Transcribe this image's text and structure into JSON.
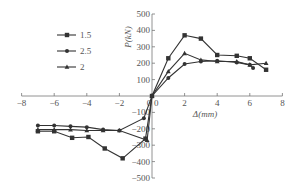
{
  "chart_data": {
    "type": "line",
    "title": "",
    "xlabel": "Δ(mm)",
    "ylabel": "P(kN)",
    "xlim": [
      -8,
      8
    ],
    "ylim": [
      -500,
      500
    ],
    "x_ticks": [
      -8,
      -6,
      -4,
      -2,
      0,
      2,
      4,
      6,
      8
    ],
    "y_ticks": [
      -500,
      -400,
      -300,
      -200,
      -100,
      100,
      200,
      300,
      400,
      500
    ],
    "grid": false,
    "legend_position": "upper left",
    "series": [
      {
        "name": "1.5",
        "marker": "square",
        "points": [
          [
            -7,
            -215
          ],
          [
            -6,
            -215
          ],
          [
            -4.9,
            -255
          ],
          [
            -3.9,
            -250
          ],
          [
            -2.9,
            -320
          ],
          [
            -1.8,
            -380
          ],
          [
            -0.4,
            -260
          ],
          [
            0,
            0
          ],
          [
            1,
            230
          ],
          [
            2,
            370
          ],
          [
            3,
            350
          ],
          [
            4,
            250
          ],
          [
            5.2,
            245
          ],
          [
            6,
            230
          ],
          [
            7,
            160
          ]
        ]
      },
      {
        "name": "2.5",
        "marker": "circle",
        "points": [
          [
            -7,
            -180
          ],
          [
            -6,
            -180
          ],
          [
            -5,
            -185
          ],
          [
            -4,
            -190
          ],
          [
            -3,
            -205
          ],
          [
            -2,
            -210
          ],
          [
            -0.5,
            -135
          ],
          [
            0,
            0
          ],
          [
            1,
            110
          ],
          [
            2,
            195
          ],
          [
            3,
            210
          ],
          [
            4,
            215
          ],
          [
            5.2,
            205
          ],
          [
            6,
            190
          ],
          [
            6.2,
            170
          ]
        ]
      },
      {
        "name": "2",
        "marker": "triangle",
        "points": [
          [
            -7,
            -205
          ],
          [
            -6,
            -205
          ],
          [
            -5,
            -205
          ],
          [
            -4,
            -210
          ],
          [
            -3,
            -210
          ],
          [
            -2,
            -210
          ],
          [
            -0.3,
            -270
          ],
          [
            0,
            0
          ],
          [
            1,
            150
          ],
          [
            2,
            260
          ],
          [
            3,
            220
          ],
          [
            4,
            210
          ],
          [
            5.2,
            210
          ],
          [
            6,
            190
          ],
          [
            7,
            200
          ]
        ]
      }
    ]
  },
  "legend": {
    "items": [
      {
        "label": "1.5",
        "marker": "square"
      },
      {
        "label": "2.5",
        "marker": "circle"
      },
      {
        "label": "2",
        "marker": "triangle"
      }
    ]
  },
  "axes": {
    "x_title": "Δ(mm)",
    "y_title": "P(kN)",
    "x_tick_labels": [
      "-8",
      "-6",
      "-4",
      "-2",
      "0",
      "2",
      "4",
      "6",
      "8"
    ],
    "y_tick_labels_pos": [
      "100",
      "200",
      "300",
      "400",
      "500"
    ],
    "y_tick_labels_neg": [
      "-100",
      "-200",
      "-300",
      "-400",
      "-500"
    ]
  },
  "colors": {
    "line": "#333333",
    "axis": "#777777",
    "text": "#555555"
  }
}
